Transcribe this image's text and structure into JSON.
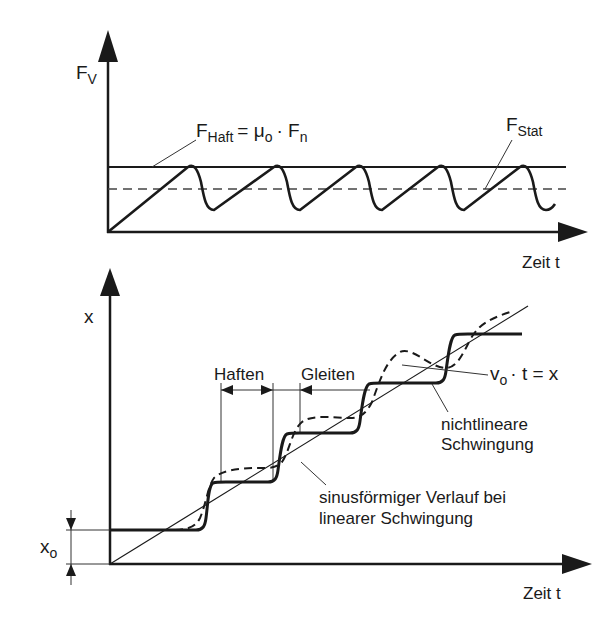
{
  "top_plot": {
    "y_axis_label": "F",
    "y_axis_label_sub": "V",
    "x_axis_label": "Zeit t",
    "haft_label": "F",
    "haft_label_sub": "Haft",
    "haft_eq": "= μ",
    "haft_eq_sub": "o",
    "haft_eq_rest": "· F",
    "haft_eq_rest_sub": "n",
    "stat_label": "F",
    "stat_label_sub": "Stat"
  },
  "bottom_plot": {
    "y_axis_label": "x",
    "x_axis_label": "Zeit t",
    "x0_label": "x",
    "x0_label_sub": "o",
    "haften_label": "Haften",
    "gleiten_label": "Gleiten",
    "linear_label_a": "v",
    "linear_label_a_sub": "o",
    "linear_label_b": "· t = x",
    "nonlinear_label_line1": "nichtlineare",
    "nonlinear_label_line2": "Schwingung",
    "sine_label_line1": "sinusförmiger Verlauf bei",
    "sine_label_line2": "linearer Schwingung"
  },
  "colors": {
    "ink": "#1a1a1a",
    "background": "#ffffff"
  }
}
